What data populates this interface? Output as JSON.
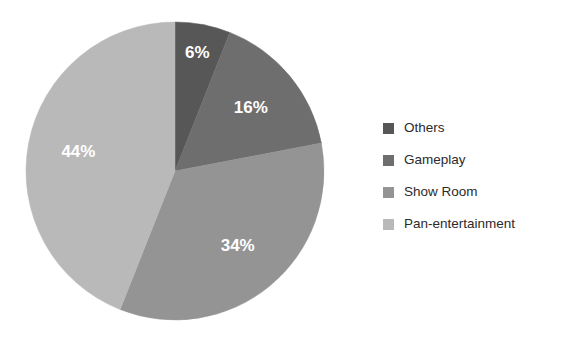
{
  "chart_data": {
    "type": "pie",
    "title": "",
    "categories": [
      "Others",
      "Gameplay",
      "Show Room",
      "Pan-entertainment"
    ],
    "values": [
      6,
      16,
      34,
      44
    ],
    "value_labels": [
      "6%",
      "16%",
      "34%",
      "44%"
    ],
    "unit": "%",
    "colors": [
      "#575757",
      "#6e6e6e",
      "#949494",
      "#b9b9b9"
    ],
    "start_angle_deg": 0,
    "direction": "clockwise",
    "legend_position": "right",
    "grid": false,
    "xlabel": "",
    "ylabel": "",
    "slices": [
      {
        "label": "Others",
        "value": 6,
        "display": "6%",
        "color": "#575757"
      },
      {
        "label": "Gameplay",
        "value": 16,
        "display": "16%",
        "color": "#6e6e6e"
      },
      {
        "label": "Show Room",
        "value": 34,
        "display": "34%",
        "color": "#949494"
      },
      {
        "label": "Pan-entertainment",
        "value": 44,
        "display": "44%",
        "color": "#b9b9b9"
      }
    ]
  },
  "legend": {
    "items": [
      {
        "label": "Others",
        "color": "#575757"
      },
      {
        "label": "Gameplay",
        "color": "#6e6e6e"
      },
      {
        "label": "Show Room",
        "color": "#949494"
      },
      {
        "label": "Pan-entertainment",
        "color": "#b9b9b9"
      }
    ]
  },
  "canvas": {
    "background": "#ffffff"
  }
}
